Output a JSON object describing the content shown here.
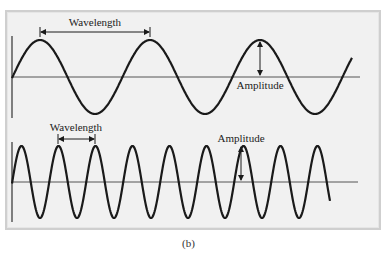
{
  "figure": {
    "caption": "(b)",
    "top_wave": {
      "wavelength_label": "Wavelength",
      "amplitude_label": "Amplitude",
      "description": "low-frequency sine wave"
    },
    "bottom_wave": {
      "wavelength_label": "Wavelength",
      "amplitude_label": "Amplitude",
      "description": "high-frequency sine wave"
    },
    "colors": {
      "wave": "#1a1a1a",
      "axis": "#555555",
      "panel_bg": "#f1f1f1",
      "panel_border": "#cfcfcf"
    }
  }
}
